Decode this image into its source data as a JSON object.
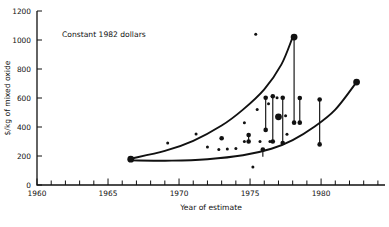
{
  "figure": {
    "annotation": "Constant 1982 dollars",
    "background": "#ffffff",
    "ink_color": "#111111"
  },
  "chart_data": {
    "type": "scatter",
    "title": "",
    "subtitle": "",
    "annotations": [
      "Constant 1982 dollars"
    ],
    "xlabel": "Year of estimate",
    "ylabel": "$/kg of mixed oxide",
    "xlim": [
      1960,
      1984.5
    ],
    "ylim": [
      0,
      1200
    ],
    "grid": false,
    "legend": "none",
    "x_ticks_major": [
      1960,
      1965,
      1970,
      1975,
      1980
    ],
    "x_tick_labels": [
      "1960",
      "1965",
      "1970",
      "1975",
      "1980"
    ],
    "x_tick_minor_interval": 1,
    "y_ticks": [
      0,
      200,
      400,
      600,
      800,
      1000,
      1200
    ],
    "y_tick_labels": [
      "0",
      "200",
      "400",
      "600",
      "800",
      "1000",
      "1200"
    ],
    "series": [
      {
        "name": "upper envelope",
        "type": "line",
        "points": [
          {
            "x": 1966.6,
            "y": 182
          },
          {
            "x": 1969.0,
            "y": 235
          },
          {
            "x": 1971.0,
            "y": 305
          },
          {
            "x": 1973.0,
            "y": 410
          },
          {
            "x": 1974.5,
            "y": 520
          },
          {
            "x": 1976.0,
            "y": 660
          },
          {
            "x": 1977.2,
            "y": 830
          },
          {
            "x": 1978.0,
            "y": 1020
          }
        ]
      },
      {
        "name": "lower envelope",
        "type": "line",
        "points": [
          {
            "x": 1966.6,
            "y": 170
          },
          {
            "x": 1969.5,
            "y": 168
          },
          {
            "x": 1972.0,
            "y": 178
          },
          {
            "x": 1974.5,
            "y": 205
          },
          {
            "x": 1976.5,
            "y": 250
          },
          {
            "x": 1978.0,
            "y": 310
          },
          {
            "x": 1979.5,
            "y": 400
          },
          {
            "x": 1981.0,
            "y": 520
          },
          {
            "x": 1982.5,
            "y": 710
          }
        ]
      }
    ],
    "scatter_points": [
      {
        "x": 1966.6,
        "y": 178,
        "size": "large"
      },
      {
        "x": 1969.2,
        "y": 290,
        "size": "small"
      },
      {
        "x": 1971.2,
        "y": 352,
        "size": "small"
      },
      {
        "x": 1972.0,
        "y": 262,
        "size": "small"
      },
      {
        "x": 1972.8,
        "y": 245,
        "size": "small"
      },
      {
        "x": 1973.4,
        "y": 248,
        "size": "small"
      },
      {
        "x": 1973.0,
        "y": 322,
        "size": "medium"
      },
      {
        "x": 1974.0,
        "y": 252,
        "size": "small"
      },
      {
        "x": 1974.6,
        "y": 430,
        "size": "small"
      },
      {
        "x": 1974.6,
        "y": 300,
        "size": "small"
      },
      {
        "x": 1975.2,
        "y": 124,
        "size": "small"
      },
      {
        "x": 1975.4,
        "y": 1040,
        "size": "small"
      },
      {
        "x": 1975.5,
        "y": 520,
        "size": "small"
      },
      {
        "x": 1975.7,
        "y": 300,
        "size": "small"
      },
      {
        "x": 1976.1,
        "y": 602,
        "size": "small"
      },
      {
        "x": 1976.3,
        "y": 560,
        "size": "small"
      },
      {
        "x": 1976.4,
        "y": 300,
        "size": "small"
      },
      {
        "x": 1976.6,
        "y": 612,
        "size": "small"
      },
      {
        "x": 1976.9,
        "y": 602,
        "size": "small"
      },
      {
        "x": 1977.3,
        "y": 602,
        "size": "small"
      },
      {
        "x": 1977.0,
        "y": 470,
        "size": "large"
      },
      {
        "x": 1977.5,
        "y": 478,
        "size": "small"
      },
      {
        "x": 1977.6,
        "y": 350,
        "size": "small"
      },
      {
        "x": 1978.5,
        "y": 600,
        "size": "small"
      },
      {
        "x": 1979.9,
        "y": 590,
        "size": "small"
      },
      {
        "x": 1978.1,
        "y": 1020,
        "size": "large"
      },
      {
        "x": 1982.5,
        "y": 710,
        "size": "large"
      }
    ],
    "error_bars": [
      {
        "x": 1976.1,
        "y_low": 380,
        "y_high": 602,
        "cap_top": true,
        "cap_bottom": true
      },
      {
        "x": 1976.6,
        "y_low": 300,
        "y_high": 612,
        "cap_top": true,
        "cap_bottom": true
      },
      {
        "x": 1977.3,
        "y_low": 290,
        "y_high": 602,
        "cap_top": true,
        "cap_bottom": true
      },
      {
        "x": 1978.1,
        "y_low": 430,
        "y_high": 1020,
        "cap_top": true,
        "cap_bottom": true
      },
      {
        "x": 1978.5,
        "y_low": 430,
        "y_high": 600,
        "cap_top": true,
        "cap_bottom": true
      },
      {
        "x": 1979.9,
        "y_low": 280,
        "y_high": 590,
        "cap_top": true,
        "cap_bottom": true
      },
      {
        "x": 1974.9,
        "y_low": 300,
        "y_high": 345,
        "cap_top": true,
        "cap_bottom": true
      },
      {
        "x": 1975.9,
        "y_low": 195,
        "y_high": 245,
        "cap_top": true,
        "cap_bottom": false
      }
    ]
  }
}
